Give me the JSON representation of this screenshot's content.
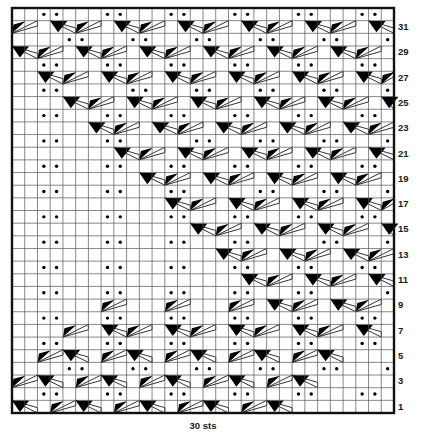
{
  "chart": {
    "title": "",
    "type": "knitting-chart",
    "stitch_count_label": "30 sts",
    "columns": 30,
    "rows": 32,
    "row_labels": [
      "31",
      "29",
      "27",
      "25",
      "23",
      "21",
      "19",
      "17",
      "15",
      "13",
      "11",
      "9",
      "7",
      "5",
      "3",
      "1"
    ],
    "colors": {
      "grid_line": "#555555",
      "border": "#111111",
      "symbol": "#000000",
      "background": "#ffffff",
      "text": "#1a1a1a"
    },
    "legend_symbols": {
      "purl": "purl-dot",
      "right_twist": "right-leaning-twist",
      "left_twist": "left-leaning-twist"
    },
    "purl_cells": [
      {
        "row": 32,
        "cols": [
          3,
          4,
          8,
          9,
          13,
          14,
          18,
          19,
          23,
          24,
          28,
          29
        ]
      },
      {
        "row": 30,
        "cols": [
          5,
          6,
          10,
          11,
          15,
          16,
          20,
          21,
          25,
          26,
          30
        ]
      },
      {
        "row": 28,
        "cols": [
          3,
          4,
          8,
          9,
          13,
          14,
          18,
          19,
          23,
          24,
          28,
          29
        ]
      },
      {
        "row": 26,
        "cols": [
          3,
          4,
          10,
          11,
          15,
          16,
          20,
          21,
          25,
          26,
          30
        ]
      },
      {
        "row": 24,
        "cols": [
          3,
          4,
          8,
          9,
          13,
          14,
          18,
          19,
          23,
          24,
          28,
          29
        ]
      },
      {
        "row": 22,
        "cols": [
          3,
          4,
          8,
          9,
          15,
          16,
          20,
          21,
          25,
          26,
          30
        ]
      },
      {
        "row": 20,
        "cols": [
          3,
          4,
          8,
          9,
          13,
          14,
          18,
          19,
          23,
          24,
          28,
          29
        ]
      },
      {
        "row": 18,
        "cols": [
          3,
          4,
          8,
          9,
          13,
          14,
          20,
          21,
          25,
          26,
          30
        ]
      },
      {
        "row": 16,
        "cols": [
          3,
          4,
          8,
          9,
          13,
          14,
          18,
          19,
          23,
          24,
          28,
          29
        ]
      },
      {
        "row": 14,
        "cols": [
          3,
          4,
          8,
          9,
          13,
          14,
          18,
          19,
          25,
          26,
          30
        ]
      },
      {
        "row": 12,
        "cols": [
          3,
          4,
          8,
          9,
          13,
          14,
          18,
          19,
          23,
          24,
          28,
          29
        ]
      },
      {
        "row": 10,
        "cols": [
          3,
          4,
          8,
          9,
          13,
          14,
          18,
          19,
          23,
          24,
          30
        ]
      },
      {
        "row": 8,
        "cols": [
          3,
          4,
          8,
          9,
          13,
          14,
          18,
          19,
          23,
          24,
          28,
          29
        ]
      },
      {
        "row": 6,
        "cols": [
          3,
          4,
          8,
          9,
          13,
          14,
          18,
          19,
          23,
          24,
          28,
          29
        ]
      },
      {
        "row": 4,
        "cols": [
          5,
          6,
          10,
          11,
          15,
          16,
          20,
          21,
          25,
          26,
          30
        ]
      },
      {
        "row": 2,
        "cols": [
          3,
          4,
          8,
          9,
          13,
          14,
          18,
          19,
          23,
          24,
          28,
          29
        ]
      }
    ],
    "twist_cells": [
      {
        "row": 31,
        "right": [
          1,
          6,
          11,
          16,
          21,
          26
        ],
        "left": [
          4,
          9,
          14,
          19,
          24,
          29
        ]
      },
      {
        "row": 29,
        "right": [
          3,
          8,
          13,
          18,
          23,
          28
        ],
        "left": [
          1,
          6,
          11,
          16,
          21,
          26
        ]
      },
      {
        "row": 27,
        "right": [
          5,
          10,
          15,
          20,
          25,
          30
        ],
        "left": [
          3,
          8,
          13,
          18,
          23,
          28
        ]
      },
      {
        "row": 25,
        "right": [
          7,
          12,
          17,
          22,
          27
        ],
        "left": [
          5,
          10,
          15,
          20,
          25,
          30
        ]
      },
      {
        "row": 23,
        "right": [
          9,
          14,
          19,
          24,
          29
        ],
        "left": [
          7,
          12,
          17,
          22,
          27
        ]
      },
      {
        "row": 21,
        "right": [
          11,
          16,
          21,
          26
        ],
        "left": [
          9,
          14,
          19,
          24,
          29
        ]
      },
      {
        "row": 19,
        "right": [
          13,
          18,
          23,
          28
        ],
        "left": [
          11,
          16,
          21,
          26
        ]
      },
      {
        "row": 17,
        "right": [
          15,
          20,
          25,
          30
        ],
        "left": [
          13,
          18,
          23,
          28
        ]
      },
      {
        "row": 15,
        "right": [
          17,
          22,
          27
        ],
        "left": [
          15,
          20,
          25,
          30
        ]
      },
      {
        "row": 13,
        "right": [
          19,
          24,
          29
        ],
        "left": [
          17,
          22,
          27
        ]
      },
      {
        "row": 11,
        "right": [
          21,
          26
        ],
        "left": [
          19,
          24,
          29
        ]
      },
      {
        "row": 9,
        "right": [
          8,
          13,
          18,
          23,
          28
        ],
        "left": [
          21,
          26
        ]
      },
      {
        "row": 7,
        "right": [
          5,
          10,
          15,
          20,
          25
        ],
        "left": [
          8,
          13,
          18,
          23,
          28
        ]
      },
      {
        "row": 5,
        "right": [
          3,
          8,
          13,
          18,
          23
        ],
        "left": [
          5,
          10,
          15,
          20,
          25
        ]
      },
      {
        "row": 3,
        "right": [
          1,
          6,
          11,
          16,
          21
        ],
        "left": [
          3,
          8,
          13,
          18,
          23
        ]
      },
      {
        "row": 1,
        "right": [
          4,
          9,
          14,
          19
        ],
        "left": [
          1,
          6,
          11,
          16,
          21
        ]
      }
    ]
  }
}
